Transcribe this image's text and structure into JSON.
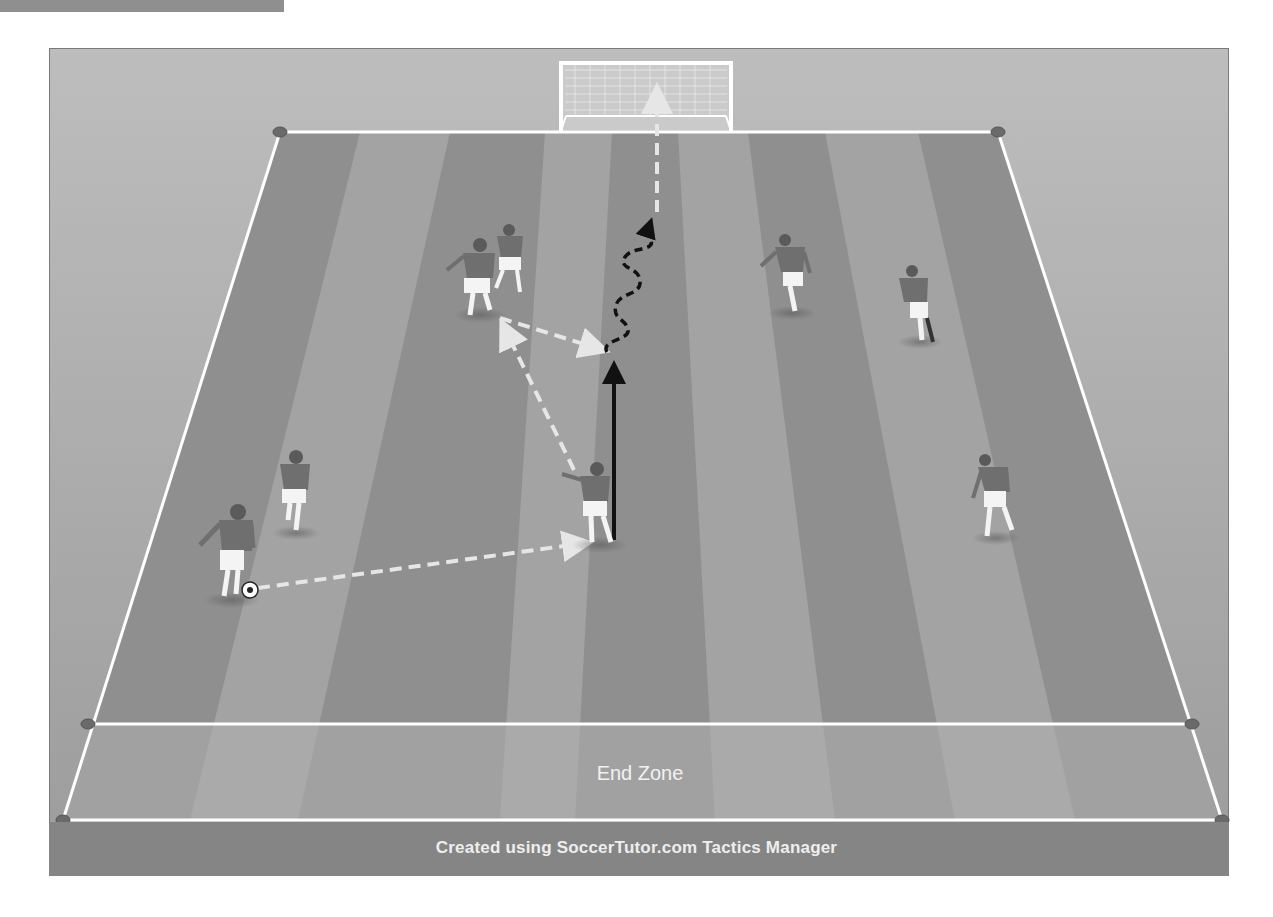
{
  "diagram": {
    "end_zone_label": "End Zone",
    "footer_credit": "Created using SoccerTutor.com Tactics Manager",
    "colors": {
      "frame_bg": "#b3b3b3",
      "stripe_dark": "#8e8e8e",
      "stripe_light": "#a4a4a4",
      "lines": "#ffffff",
      "footer_bg": "#858585",
      "player_shirt": "#6f6f6f",
      "player_shorts": "#ffffff"
    },
    "players": [
      {
        "id": "p1",
        "x": 228,
        "y": 548,
        "role": "ball-carrier",
        "has_ball": true
      },
      {
        "id": "p2",
        "x": 293,
        "y": 490
      },
      {
        "id": "p3",
        "x": 477,
        "y": 275
      },
      {
        "id": "p4",
        "x": 511,
        "y": 255
      },
      {
        "id": "p5",
        "x": 596,
        "y": 500
      },
      {
        "id": "p6",
        "x": 790,
        "y": 270
      },
      {
        "id": "p7",
        "x": 916,
        "y": 300
      },
      {
        "id": "p8",
        "x": 993,
        "y": 492
      }
    ],
    "arrows": [
      {
        "type": "pass",
        "style": "white-dashed",
        "from": [
          258,
          588
        ],
        "to": [
          590,
          543
        ]
      },
      {
        "type": "pass",
        "style": "white-dashed",
        "from": [
          574,
          470
        ],
        "to": [
          500,
          320
        ]
      },
      {
        "type": "pass",
        "style": "white-dashed",
        "from": [
          500,
          318
        ],
        "to": [
          607,
          352
        ]
      },
      {
        "type": "run",
        "style": "black-solid",
        "from": [
          614,
          540
        ],
        "to": [
          614,
          360
        ]
      },
      {
        "type": "dribble",
        "style": "black-wavy-dashed",
        "from": [
          607,
          352
        ],
        "to": [
          656,
          215
        ]
      },
      {
        "type": "shot",
        "style": "white-dashed",
        "from": [
          657,
          212
        ],
        "to": [
          657,
          85
        ]
      }
    ],
    "goal": {
      "x": 559,
      "y": 62,
      "width": 174,
      "height": 68
    }
  }
}
